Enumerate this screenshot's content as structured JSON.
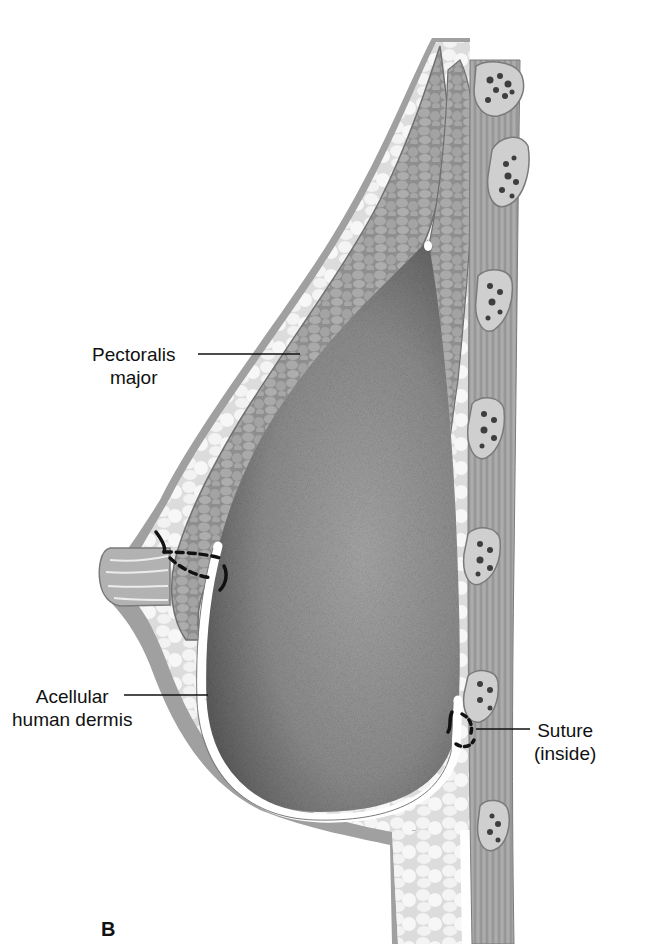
{
  "figure": {
    "panel_letter": "B",
    "labels": [
      {
        "id": "pectoralis",
        "lines": [
          "Pectoralis",
          "major"
        ]
      },
      {
        "id": "dermis",
        "lines": [
          "Acellular",
          "human dermis"
        ]
      },
      {
        "id": "suture",
        "lines": [
          "Suture",
          "(inside)"
        ]
      }
    ],
    "colors": {
      "skin": "#9a9a9a",
      "fat": "#e9e9e9",
      "muscle": "#a5a5a5",
      "implant": "#8a8a8a",
      "dermis_sling": "#ffffff",
      "rib": "#c8c8c8",
      "rib_marrow": "#3e3e3e",
      "chest_wall": "#9c9c9c",
      "suture": "#111111"
    }
  }
}
